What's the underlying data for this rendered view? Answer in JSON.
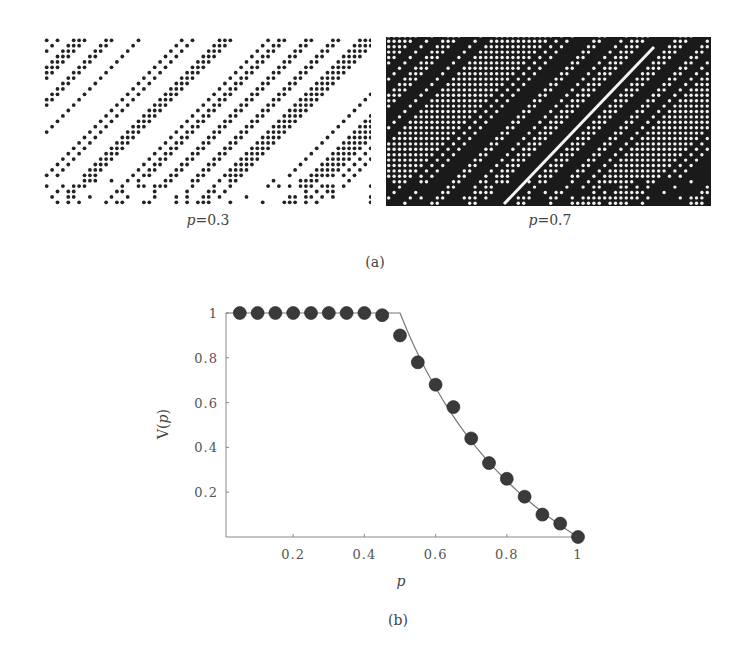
{
  "figure_a": {
    "panels": [
      {
        "id": "left",
        "label": "p=0.3",
        "p_symbol": "p",
        "p_value": "=0.3",
        "background": "#ffffff",
        "dot_color": "#222222",
        "box": {
          "x": 44,
          "y": 37,
          "w": 327,
          "h": 168
        }
      },
      {
        "id": "right",
        "label": "p=0.7",
        "p_symbol": "p",
        "p_value": "=0.7",
        "background": "#1a1a1a",
        "dot_color": "#f2f2f2",
        "box": {
          "x": 386,
          "y": 37,
          "w": 325,
          "h": 169
        }
      }
    ],
    "caption": "(a)"
  },
  "figure_b": {
    "caption": "(b)"
  },
  "chart_data": {
    "type": "scatter",
    "title": "",
    "xlabel": "p",
    "ylabel": "V(p)",
    "xlim": [
      0,
      1
    ],
    "ylim": [
      0,
      1
    ],
    "xticks": [
      0.2,
      0.4,
      0.6,
      0.8,
      1
    ],
    "xtick_labels": [
      "0.2",
      "0.4",
      "0.6",
      "0.8",
      "1"
    ],
    "yticks": [
      0.2,
      0.4,
      0.6,
      0.8,
      1
    ],
    "ytick_labels": [
      "0.2",
      "0.4",
      "0.6",
      "0.8",
      "1"
    ],
    "grid": false,
    "legend": null,
    "series": [
      {
        "name": "simulation",
        "kind": "markers",
        "marker": "filled-circle",
        "color": "#3a3a3a",
        "x": [
          0.05,
          0.1,
          0.15,
          0.2,
          0.25,
          0.3,
          0.35,
          0.4,
          0.45,
          0.5,
          0.55,
          0.6,
          0.65,
          0.7,
          0.75,
          0.8,
          0.85,
          0.9,
          0.95,
          1.0
        ],
        "y": [
          1.0,
          1.0,
          1.0,
          1.0,
          1.0,
          1.0,
          1.0,
          1.0,
          0.99,
          0.9,
          0.78,
          0.68,
          0.58,
          0.44,
          0.33,
          0.26,
          0.18,
          0.1,
          0.06,
          0.0
        ]
      },
      {
        "name": "theory",
        "kind": "line",
        "color": "#777777",
        "x": [
          0.0,
          0.5,
          0.55,
          0.6,
          0.65,
          0.7,
          0.75,
          0.8,
          0.85,
          0.9,
          0.95,
          1.0
        ],
        "y": [
          1.0,
          1.0,
          0.818,
          0.667,
          0.538,
          0.429,
          0.333,
          0.25,
          0.176,
          0.111,
          0.053,
          0.0
        ]
      }
    ]
  }
}
